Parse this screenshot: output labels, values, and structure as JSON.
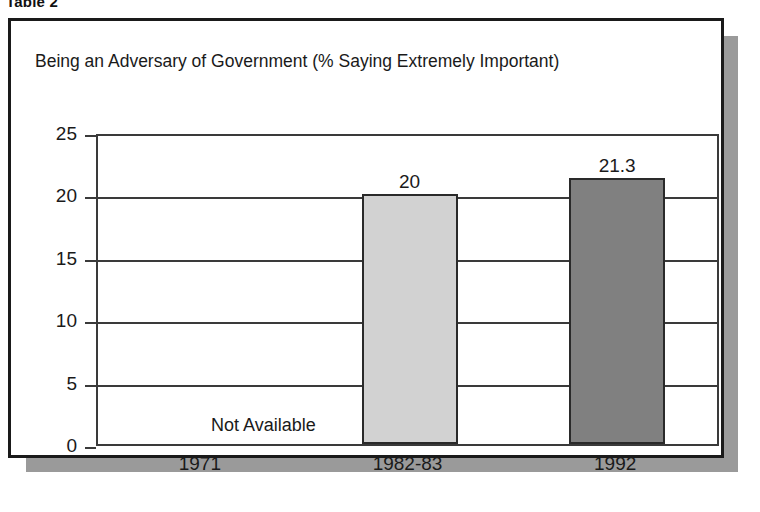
{
  "figure": {
    "caption": "Table 2"
  },
  "chart_data": {
    "type": "bar",
    "title": "Being an Adversary of Government (% Saying Extremely Important)",
    "xlabel": "",
    "ylabel": "",
    "categories": [
      "1971",
      "1982-83",
      "1992"
    ],
    "values": [
      null,
      20,
      21.3
    ],
    "value_labels": [
      "",
      "20",
      "21.3"
    ],
    "missing_label": "Not Available",
    "ylim": [
      0,
      25
    ],
    "yticks": [
      0,
      5,
      10,
      15,
      20,
      25
    ],
    "ytick_labels": [
      "0",
      "5",
      "10",
      "15",
      "20",
      "25"
    ],
    "grid": true,
    "legend": false,
    "bar_colors": [
      "#ffffff",
      "#d2d2d2",
      "#808080"
    ],
    "bar_border_color": "#2a2a2a",
    "axis_color": "#3a3a3a",
    "text_color": "#1a1a1a"
  }
}
